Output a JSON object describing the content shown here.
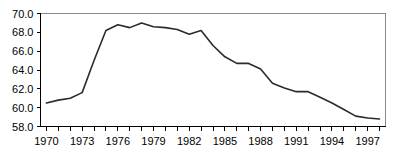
{
  "chart_data": {
    "type": "line",
    "title": "",
    "subtitle": "",
    "xlabel": "",
    "ylabel": "",
    "xlim": [
      1969.5,
      1998.5
    ],
    "ylim": [
      58.0,
      70.0
    ],
    "grid": false,
    "legend": null,
    "y_ticks": [
      "70.0",
      "68.0",
      "66.0",
      "64.0",
      "62.0",
      "60.0",
      "58.0"
    ],
    "y_tick_values": [
      70.0,
      68.0,
      66.0,
      64.0,
      62.0,
      60.0,
      58.0
    ],
    "x_tick_labels": [
      "1970",
      "1973",
      "1976",
      "1979",
      "1982",
      "1985",
      "1988",
      "1991",
      "1994",
      "1997"
    ],
    "x_tick_values": [
      1970,
      1973,
      1976,
      1979,
      1982,
      1985,
      1988,
      1991,
      1994,
      1997
    ],
    "x_minor_ticks": [
      1970,
      1971,
      1972,
      1973,
      1974,
      1975,
      1976,
      1977,
      1978,
      1979,
      1980,
      1981,
      1982,
      1983,
      1984,
      1985,
      1986,
      1987,
      1988,
      1989,
      1990,
      1991,
      1992,
      1993,
      1994,
      1995,
      1996,
      1997,
      1998
    ],
    "x": [
      1970,
      1971,
      1972,
      1973,
      1974,
      1975,
      1976,
      1977,
      1978,
      1979,
      1980,
      1981,
      1982,
      1983,
      1984,
      1985,
      1986,
      1987,
      1988,
      1989,
      1990,
      1991,
      1992,
      1993,
      1994,
      1995,
      1996,
      1997,
      1998
    ],
    "values": [
      60.5,
      60.8,
      61.0,
      61.6,
      65.0,
      68.2,
      68.8,
      68.5,
      69.0,
      68.6,
      68.5,
      68.3,
      67.8,
      68.2,
      66.6,
      65.4,
      64.7,
      64.7,
      64.1,
      62.6,
      62.1,
      61.7,
      61.7,
      61.1,
      60.5,
      59.8,
      59.1,
      58.9,
      58.8
    ],
    "series": [
      {
        "name": "series-1",
        "color": "#2b2b2b",
        "values": [
          60.5,
          60.8,
          61.0,
          61.6,
          65.0,
          68.2,
          68.8,
          68.5,
          69.0,
          68.6,
          68.5,
          68.3,
          67.8,
          68.2,
          66.6,
          65.4,
          64.7,
          64.7,
          64.1,
          62.6,
          62.1,
          61.7,
          61.7,
          61.1,
          60.5,
          59.8,
          59.1,
          58.9,
          58.8
        ]
      }
    ],
    "colors": {
      "line": "#2b2b2b",
      "axis": "#000000",
      "frame": "#8a8a8a",
      "background": "#ffffff"
    }
  }
}
